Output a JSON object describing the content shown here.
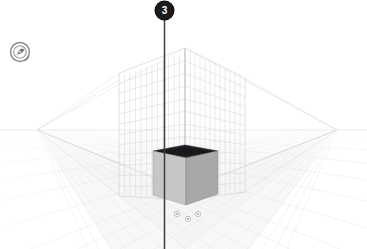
{
  "app": {
    "name": "3D Perspective Viewport",
    "background_color": "#ffffff"
  },
  "viewport": {
    "name": "3d-perspective-viewport",
    "width": 367,
    "height": 249
  },
  "nav_widget": {
    "icon": "orbit-compass-icon",
    "tooltip": "Orbit / Navigation",
    "color": "#8d8d8d"
  },
  "marker": {
    "label": "3",
    "icon": "numbered-pin-marker",
    "bg_color": "#1b1b1b",
    "text_color": "#ffffff",
    "pole_color": "#3c3c3c",
    "x": 164,
    "y_top": 20,
    "y_bottom": 249
  },
  "scene": {
    "horizon": {
      "name": "horizon-line",
      "y": 130,
      "color": "#d8d8d8"
    },
    "vanishing_points": {
      "left": {
        "x": 37,
        "y": 130
      },
      "right": {
        "x": 337,
        "y": 130
      }
    },
    "cage": {
      "name": "wireframe-grid-cage",
      "line_color": "#c9cdd2",
      "columns": 12,
      "rows": 12,
      "front_corner_x": 185,
      "top_y": 48,
      "bottom_y": 200,
      "left_edge_x": 119,
      "right_edge_x": 245
    },
    "ground": {
      "name": "ground-perspective-grid",
      "line_color": "#e3e3e3",
      "fill_color": "#f4f4f4"
    },
    "cube": {
      "name": "solid-cube",
      "top_face_color": "#26262a",
      "left_face_color": "#c3c3c3",
      "right_face_color": "#a9a9a9",
      "outline_color": "#8a8a8a",
      "top_y": 146,
      "bottom_y": 200,
      "left_x": 153,
      "right_x": 218
    },
    "handles": {
      "name": "grip-handle-dots",
      "color": "#b6b6b6",
      "points": [
        {
          "x": 177,
          "y": 214
        },
        {
          "x": 188,
          "y": 219
        },
        {
          "x": 198,
          "y": 214
        }
      ]
    }
  }
}
